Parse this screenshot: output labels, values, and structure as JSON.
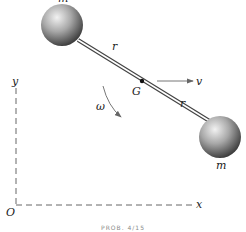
{
  "figure": {
    "labels": {
      "mass_top": "m",
      "mass_bottom": "m",
      "rod_upper": "r",
      "rod_lower": "r",
      "center": "G",
      "velocity": "v",
      "angular_velocity": "ω",
      "axis_y": "y",
      "axis_x": "x",
      "origin": "O"
    },
    "caption": "PROB. 4/15",
    "colors": {
      "sphere_light": "#e6e6e6",
      "sphere_dark": "#3a3a3a",
      "line": "#333333",
      "axis": "#555555"
    }
  }
}
